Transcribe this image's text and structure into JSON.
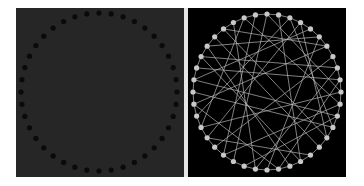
{
  "figure": {
    "left_panel": {
      "background": "#262626",
      "node_color": "#0a0a0a",
      "node_count": 40,
      "node_radius": 2.6,
      "center": [
        83,
        84
      ],
      "radius": [
        78,
        79
      ],
      "edges_visible": false
    },
    "right_panel": {
      "background": "#000000",
      "node_color": "#c8c8c8",
      "edge_color": "#bdbdbd",
      "node_count": 40,
      "node_radius": 2.6,
      "center": [
        79,
        84
      ],
      "radius": [
        74,
        78
      ],
      "ring_edges": true,
      "chords": [
        [
          0,
          23
        ],
        [
          1,
          17
        ],
        [
          2,
          28
        ],
        [
          3,
          14
        ],
        [
          4,
          31
        ],
        [
          5,
          20
        ],
        [
          6,
          36
        ],
        [
          7,
          25
        ],
        [
          8,
          33
        ],
        [
          9,
          19
        ],
        [
          10,
          27
        ],
        [
          11,
          38
        ],
        [
          12,
          22
        ],
        [
          13,
          30
        ],
        [
          15,
          35
        ],
        [
          16,
          26
        ],
        [
          18,
          34
        ],
        [
          21,
          37
        ],
        [
          24,
          39
        ],
        [
          29,
          6
        ],
        [
          32,
          9
        ],
        [
          3,
          26
        ],
        [
          11,
          24
        ],
        [
          17,
          33
        ],
        [
          2,
          13
        ],
        [
          8,
          21
        ],
        [
          14,
          36
        ],
        [
          19,
          29
        ],
        [
          0,
          10
        ],
        [
          27,
          38
        ],
        [
          5,
          34
        ],
        [
          12,
          31
        ]
      ]
    }
  }
}
